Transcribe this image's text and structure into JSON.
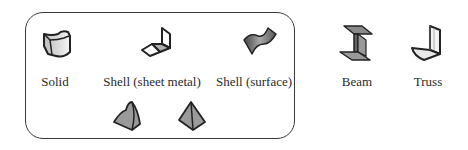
{
  "group": {
    "name": "shell-and-solid-group"
  },
  "elements": [
    {
      "id": "solid",
      "label": "Solid",
      "icon": "solid-icon"
    },
    {
      "id": "shell-sheet-metal",
      "label": "Shell (sheet metal)",
      "icon": "sheet-metal-icon"
    },
    {
      "id": "shell-surface",
      "label": "Shell (surface)",
      "icon": "surface-icon"
    },
    {
      "id": "beam",
      "label": "Beam",
      "icon": "beam-icon"
    },
    {
      "id": "truss",
      "label": "Truss",
      "icon": "truss-icon"
    }
  ],
  "extra_icons": [
    {
      "id": "tetra-curved",
      "icon": "curved-tetrahedron-icon"
    },
    {
      "id": "tetra",
      "icon": "tetrahedron-icon"
    }
  ]
}
